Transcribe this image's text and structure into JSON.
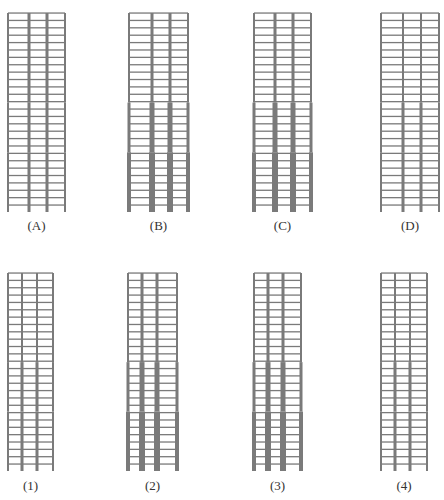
{
  "figure": {
    "colors": {
      "beam": "#7a7a7a",
      "column": "#7a7a7a",
      "label": "#333333",
      "background": "#ffffff"
    }
  },
  "rows": [
    {
      "name": "top-row",
      "top": 13,
      "last_beam": 205,
      "base": 212,
      "label_y": 218,
      "stories": 26,
      "frames": [
        {
          "id": "A",
          "label": "(A)",
          "cols": [
            8,
            29,
            47,
            65
          ],
          "col_widths": {
            "exterior": [
              2,
              2,
              2
            ],
            "interior": [
              3,
              3,
              3
            ]
          }
        },
        {
          "id": "B",
          "label": "(B)",
          "cols": [
            129,
            152,
            170,
            188
          ],
          "col_widths": {
            "exterior": [
              2,
              3,
              4
            ],
            "interior": [
              3,
              5,
              6
            ]
          }
        },
        {
          "id": "C",
          "label": "(C)",
          "cols": [
            254,
            275,
            293,
            311
          ],
          "col_widths": {
            "exterior": [
              2,
              3,
              4
            ],
            "interior": [
              3,
              5,
              6
            ]
          }
        },
        {
          "id": "D",
          "label": "(D)",
          "cols": [
            381,
            403,
            421,
            439
          ],
          "col_widths": {
            "exterior": [
              2,
              2,
              2
            ],
            "interior": [
              2,
              3,
              3
            ]
          }
        }
      ]
    },
    {
      "name": "bottom-row",
      "top": 273,
      "last_beam": 464,
      "base": 471,
      "label_y": 478,
      "stories": 26,
      "frames": [
        {
          "id": "1",
          "label": "(1)",
          "cols": [
            8,
            22,
            37,
            53
          ],
          "col_widths": {
            "exterior": [
              2,
              2,
              2
            ],
            "interior": [
              2,
              3,
              3
            ]
          }
        },
        {
          "id": "2",
          "label": "(2)",
          "cols": [
            128,
            142,
            157,
            177
          ],
          "col_widths": {
            "exterior": [
              2,
              3,
              4
            ],
            "interior": [
              3,
              5,
              6
            ]
          }
        },
        {
          "id": "3",
          "label": "(3)",
          "cols": [
            254,
            268,
            283,
            301
          ],
          "col_widths": {
            "exterior": [
              2,
              3,
              4
            ],
            "interior": [
              3,
              5,
              6
            ]
          }
        },
        {
          "id": "4",
          "label": "(4)",
          "cols": [
            381,
            395,
            410,
            427
          ],
          "col_widths": {
            "exterior": [
              2,
              2,
              2
            ],
            "interior": [
              2,
              3,
              3
            ]
          }
        }
      ]
    }
  ],
  "zones": {
    "upper_fraction": 0.45,
    "middle_fraction": 0.25
  }
}
